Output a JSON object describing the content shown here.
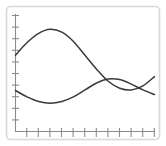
{
  "figure": {
    "name": "two-curve-line-plot",
    "background_color": "#ffffff",
    "frame_color": "#d8d8d8",
    "axis_color": "#8c8c8c",
    "curve_color": "#3a3a3a"
  },
  "chart_data": {
    "type": "line",
    "title": "",
    "subtitle": "",
    "xlabel": "",
    "ylabel": "",
    "grid": false,
    "legend": null,
    "legend_position": "none",
    "xlim": [
      0,
      12
    ],
    "ylim": [
      0,
      10
    ],
    "x_tick_labels": [],
    "y_tick_labels": [],
    "x_tick_count": 12,
    "y_tick_count": 10,
    "annotations": [],
    "x": [
      0,
      1,
      2,
      3,
      4,
      5,
      6,
      7,
      8,
      9,
      10,
      11,
      12
    ],
    "series": [
      {
        "name": "curve-1",
        "color": "#3a3a3a",
        "values": [
          6.6,
          7.7,
          8.5,
          8.85,
          8.6,
          7.8,
          6.6,
          5.4,
          4.35,
          3.75,
          3.6,
          3.95,
          4.75
        ]
      },
      {
        "name": "curve-2",
        "color": "#3a3a3a",
        "values": [
          3.55,
          3.0,
          2.6,
          2.45,
          2.6,
          3.0,
          3.6,
          4.2,
          4.55,
          4.5,
          4.1,
          3.6,
          3.2
        ]
      }
    ]
  }
}
